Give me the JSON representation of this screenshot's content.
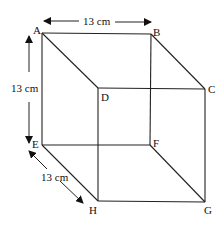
{
  "diagram": {
    "vertices": {
      "A": {
        "label": "A"
      },
      "B": {
        "label": "B"
      },
      "C": {
        "label": "C"
      },
      "D": {
        "label": "D"
      },
      "E": {
        "label": "E"
      },
      "F": {
        "label": "F"
      },
      "G": {
        "label": "G"
      },
      "H": {
        "label": "H"
      }
    },
    "dimensions": {
      "width": "13 cm",
      "height": "13 cm",
      "depth": "13 cm"
    },
    "colors": {
      "line": "#222222",
      "background": "#ffffff"
    }
  }
}
